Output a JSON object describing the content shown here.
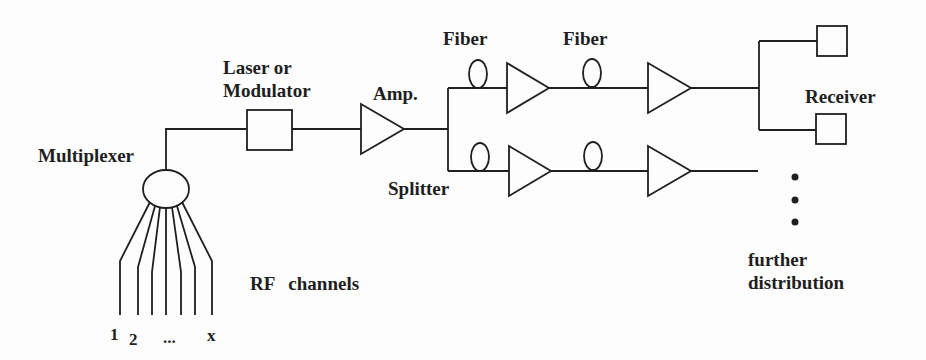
{
  "diagram": {
    "type": "block-diagram",
    "ink_color": "#1f1f1f",
    "background_color": "#fdfdfd",
    "labels": {
      "multiplexer": "Multiplexer",
      "laser_modulator_line1": "Laser or",
      "laser_modulator_line2": "Modulator",
      "amp": "Amp.",
      "fiber_upper_1": "Fiber",
      "fiber_upper_2": "Fiber",
      "splitter": "Splitter",
      "receiver": "Receiver",
      "rf_channels": "RF channels",
      "further_distribution_line1": "further",
      "further_distribution_line2": "distribution"
    },
    "channel_labels": [
      "1",
      "2",
      "...",
      "x"
    ],
    "components": [
      "multiplexer-circle",
      "laser-modulator-box",
      "amplifier-triangle",
      "splitter-junction",
      "fiber-coil-loop",
      "line-amplifier-triangle",
      "receiver-box",
      "further-distribution-ellipsis-dots"
    ]
  }
}
